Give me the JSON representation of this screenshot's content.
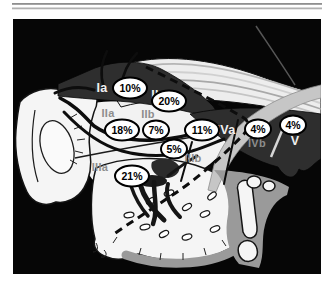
{
  "figure": {
    "regions": [
      {
        "level": "Ia",
        "percent": "10%",
        "style": "light",
        "label": {
          "x": 102,
          "y": 92
        },
        "badge": {
          "x": 130,
          "y": 88
        }
      },
      {
        "level": "Ib",
        "percent": "20%",
        "style": "light",
        "label": {
          "x": 157,
          "y": 99
        },
        "badge": {
          "x": 169,
          "y": 101
        }
      },
      {
        "level": "IIa",
        "percent": "18%",
        "style": "gray",
        "label": {
          "x": 108,
          "y": 117
        },
        "badge": {
          "x": 122,
          "y": 130
        }
      },
      {
        "level": "IIb",
        "percent": "7%",
        "style": "gray",
        "label": {
          "x": 148,
          "y": 118
        },
        "badge": {
          "x": 156,
          "y": 130
        }
      },
      {
        "level": "IIIa",
        "percent": "21%",
        "style": "gray",
        "label": {
          "x": 100,
          "y": 171
        },
        "badge": {
          "x": 132,
          "y": 176
        }
      },
      {
        "level": "IIIb",
        "percent": "5%",
        "style": "gray",
        "label": {
          "x": 193,
          "y": 162
        },
        "badge": {
          "x": 174,
          "y": 149
        }
      },
      {
        "level": "IVa",
        "percent": "11%",
        "style": "light",
        "label": {
          "x": 226,
          "y": 134
        },
        "badge": {
          "x": 202,
          "y": 130
        }
      },
      {
        "level": "IVb",
        "percent": "4%",
        "style": "gray",
        "label": {
          "x": 257,
          "y": 147
        },
        "badge": {
          "x": 258,
          "y": 129
        }
      },
      {
        "level": "V",
        "percent": "4%",
        "style": "light",
        "label": {
          "x": 295,
          "y": 145
        },
        "badge": {
          "x": 293,
          "y": 125
        }
      }
    ]
  },
  "colors": {
    "background": "#060606",
    "region_dark": "#2e2e2e",
    "strap_gray": "#c6c6c6",
    "shade_gray": "#9a9a9a",
    "bone_white": "#f5f5f5",
    "badge_fill": "#ffffff",
    "badge_stroke": "#000000",
    "label_light": "#f0f0f0",
    "label_gray": "#8d8d8d"
  }
}
